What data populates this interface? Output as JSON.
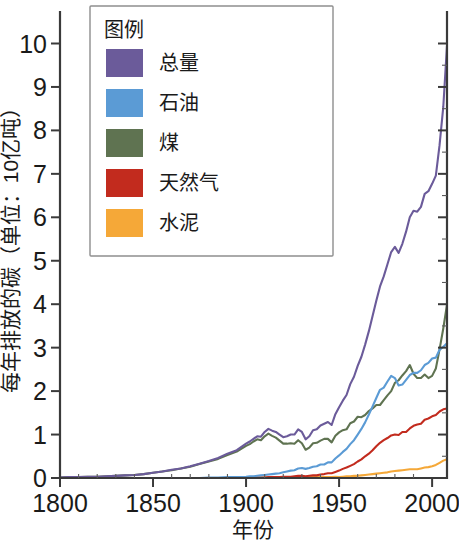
{
  "chart_data": {
    "type": "line",
    "title": "",
    "xlabel": "年份",
    "ylabel": "每年排放的碳（单位：10亿吨）",
    "xlim": [
      1800,
      2008
    ],
    "ylim": [
      0,
      10.6
    ],
    "xticks": [
      1800,
      1850,
      1900,
      1950,
      2000
    ],
    "xtick_labels": [
      "1800",
      "1850",
      "1900",
      "1950",
      "2000"
    ],
    "yticks": [
      0,
      1,
      2,
      3,
      4,
      5,
      6,
      7,
      8,
      9,
      10
    ],
    "ytick_labels": [
      "0",
      "1",
      "2",
      "3",
      "4",
      "5",
      "6",
      "7",
      "8",
      "9",
      "10"
    ],
    "grid": false,
    "legend_position": "upper-left-inside",
    "legend_title": "图例",
    "x": [
      1800,
      1805,
      1810,
      1815,
      1820,
      1825,
      1830,
      1835,
      1840,
      1845,
      1850,
      1855,
      1860,
      1865,
      1870,
      1875,
      1880,
      1885,
      1890,
      1895,
      1900,
      1902,
      1904,
      1906,
      1908,
      1910,
      1912,
      1914,
      1916,
      1918,
      1920,
      1922,
      1924,
      1926,
      1928,
      1930,
      1932,
      1934,
      1936,
      1938,
      1940,
      1942,
      1944,
      1946,
      1948,
      1950,
      1952,
      1954,
      1956,
      1958,
      1960,
      1962,
      1964,
      1966,
      1968,
      1970,
      1972,
      1974,
      1976,
      1978,
      1980,
      1982,
      1984,
      1986,
      1988,
      1990,
      1992,
      1994,
      1996,
      1998,
      2000,
      2002,
      2004,
      2006,
      2008
    ],
    "series": [
      {
        "name": "总量",
        "label": "总量",
        "color": "#6B5B9A",
        "values": [
          0.01,
          0.02,
          0.02,
          0.03,
          0.03,
          0.04,
          0.05,
          0.06,
          0.07,
          0.09,
          0.12,
          0.15,
          0.19,
          0.22,
          0.27,
          0.33,
          0.39,
          0.46,
          0.56,
          0.64,
          0.79,
          0.84,
          0.9,
          0.96,
          0.95,
          1.06,
          1.13,
          1.09,
          1.06,
          1.0,
          0.94,
          0.96,
          1.0,
          1.0,
          1.12,
          1.06,
          0.89,
          0.96,
          1.1,
          1.12,
          1.21,
          1.25,
          1.29,
          1.22,
          1.47,
          1.63,
          1.78,
          1.91,
          2.16,
          2.33,
          2.58,
          2.79,
          3.07,
          3.38,
          3.73,
          4.08,
          4.41,
          4.64,
          4.92,
          5.2,
          5.32,
          5.18,
          5.39,
          5.67,
          6.0,
          6.15,
          6.13,
          6.24,
          6.54,
          6.6,
          6.77,
          6.96,
          7.66,
          8.54,
          9.95
        ]
      },
      {
        "name": "石油",
        "label": "石油",
        "color": "#5B9BD5",
        "values": [
          0.0,
          0.0,
          0.0,
          0.0,
          0.0,
          0.0,
          0.0,
          0.0,
          0.0,
          0.0,
          0.0,
          0.0,
          0.0,
          0.0,
          0.0,
          0.0,
          0.01,
          0.01,
          0.02,
          0.02,
          0.03,
          0.04,
          0.04,
          0.05,
          0.06,
          0.07,
          0.08,
          0.09,
          0.1,
          0.11,
          0.13,
          0.15,
          0.17,
          0.18,
          0.22,
          0.23,
          0.21,
          0.23,
          0.26,
          0.27,
          0.31,
          0.31,
          0.36,
          0.36,
          0.45,
          0.52,
          0.6,
          0.67,
          0.78,
          0.87,
          1.0,
          1.13,
          1.28,
          1.46,
          1.65,
          1.84,
          2.03,
          2.08,
          2.22,
          2.35,
          2.3,
          2.13,
          2.15,
          2.26,
          2.37,
          2.42,
          2.42,
          2.48,
          2.6,
          2.65,
          2.75,
          2.77,
          2.95,
          3.02,
          3.1
        ]
      },
      {
        "name": "煤",
        "label": "煤",
        "color": "#5F7351",
        "values": [
          0.01,
          0.02,
          0.02,
          0.03,
          0.03,
          0.04,
          0.05,
          0.06,
          0.07,
          0.09,
          0.12,
          0.15,
          0.18,
          0.22,
          0.26,
          0.32,
          0.38,
          0.44,
          0.53,
          0.61,
          0.74,
          0.78,
          0.84,
          0.89,
          0.87,
          0.96,
          1.02,
          0.97,
          0.93,
          0.86,
          0.79,
          0.79,
          0.8,
          0.79,
          0.87,
          0.8,
          0.65,
          0.7,
          0.8,
          0.81,
          0.86,
          0.9,
          0.9,
          0.82,
          0.97,
          1.05,
          1.1,
          1.12,
          1.26,
          1.3,
          1.41,
          1.4,
          1.45,
          1.54,
          1.6,
          1.68,
          1.68,
          1.79,
          1.9,
          2.0,
          2.19,
          2.25,
          2.36,
          2.46,
          2.6,
          2.4,
          2.3,
          2.3,
          2.38,
          2.3,
          2.35,
          2.52,
          2.96,
          3.44,
          3.99
        ]
      },
      {
        "name": "天然气",
        "label": "天然气",
        "color": "#C22B1E",
        "values": [
          0.0,
          0.0,
          0.0,
          0.0,
          0.0,
          0.0,
          0.0,
          0.0,
          0.0,
          0.0,
          0.0,
          0.0,
          0.0,
          0.0,
          0.0,
          0.0,
          0.0,
          0.0,
          0.0,
          0.0,
          0.0,
          0.01,
          0.01,
          0.01,
          0.01,
          0.01,
          0.02,
          0.02,
          0.02,
          0.02,
          0.03,
          0.03,
          0.03,
          0.04,
          0.05,
          0.05,
          0.04,
          0.05,
          0.06,
          0.06,
          0.08,
          0.09,
          0.11,
          0.11,
          0.14,
          0.17,
          0.21,
          0.24,
          0.28,
          0.32,
          0.38,
          0.43,
          0.5,
          0.56,
          0.64,
          0.73,
          0.81,
          0.87,
          0.92,
          0.98,
          1.0,
          0.99,
          1.06,
          1.06,
          1.14,
          1.2,
          1.23,
          1.25,
          1.34,
          1.37,
          1.42,
          1.45,
          1.53,
          1.58,
          1.6
        ]
      },
      {
        "name": "水泥",
        "label": "水泥",
        "color": "#F5A838",
        "values": [
          0.0,
          0.0,
          0.0,
          0.0,
          0.0,
          0.0,
          0.0,
          0.0,
          0.0,
          0.0,
          0.0,
          0.0,
          0.0,
          0.0,
          0.0,
          0.0,
          0.0,
          0.0,
          0.0,
          0.0,
          0.0,
          0.0,
          0.0,
          0.01,
          0.01,
          0.01,
          0.01,
          0.01,
          0.01,
          0.01,
          0.01,
          0.01,
          0.01,
          0.01,
          0.02,
          0.02,
          0.01,
          0.02,
          0.02,
          0.02,
          0.02,
          0.02,
          0.02,
          0.02,
          0.03,
          0.02,
          0.03,
          0.04,
          0.04,
          0.05,
          0.05,
          0.06,
          0.07,
          0.08,
          0.09,
          0.1,
          0.11,
          0.12,
          0.13,
          0.15,
          0.16,
          0.17,
          0.18,
          0.19,
          0.2,
          0.2,
          0.2,
          0.22,
          0.24,
          0.25,
          0.27,
          0.3,
          0.35,
          0.4,
          0.43
        ]
      }
    ]
  }
}
